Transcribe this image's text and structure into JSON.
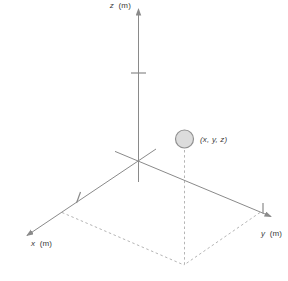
{
  "labels": {
    "z_axis": {
      "var": "z",
      "unit": "(m)"
    },
    "x_axis": {
      "var": "x",
      "unit": "(m)"
    },
    "y_axis": {
      "var": "y",
      "unit": "(m)"
    },
    "point": "(x, y, z)"
  },
  "colors": {
    "axis": "#8a8a8a",
    "dashed": "#b5b5b5",
    "text": "#3a3a3a",
    "point_fill": "#dcdcdc",
    "point_stroke": "#909090",
    "background": "#ffffff"
  }
}
